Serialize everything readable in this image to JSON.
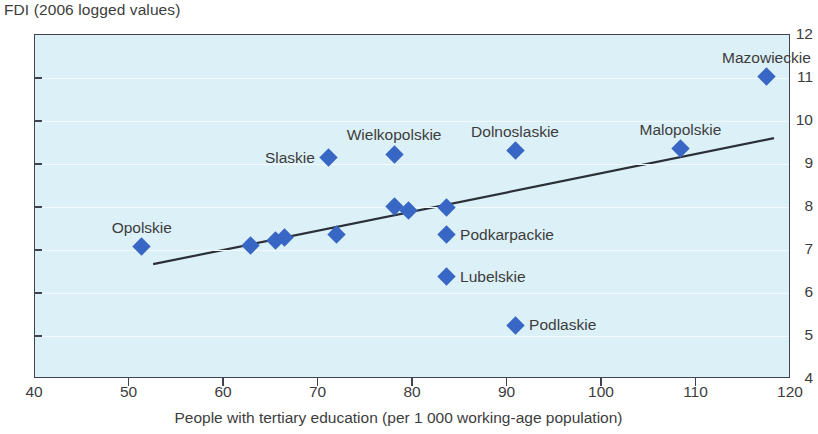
{
  "chart_data": {
    "type": "scatter",
    "title": "",
    "ylabel": "FDI (2006 logged values)",
    "xlabel": "People with tertiary education (per 1 000 working-age population)",
    "xlim": [
      40,
      120
    ],
    "ylim": [
      4,
      12
    ],
    "xticks": [
      40,
      50,
      60,
      70,
      80,
      90,
      100,
      110,
      120
    ],
    "yticks": [
      4,
      5,
      6,
      7,
      8,
      9,
      10,
      11,
      12
    ],
    "grid": true,
    "legend": "none",
    "marker_color": "#3866c4",
    "plot_background": "#dcf0f7",
    "axis_color": "#3f4450",
    "points": [
      {
        "label": "Opolskie",
        "x": 51.3,
        "y": 7.08,
        "label_pos": "above"
      },
      {
        "label": "",
        "x": 62.8,
        "y": 7.1,
        "label_pos": "none"
      },
      {
        "label": "",
        "x": 65.4,
        "y": 7.22,
        "label_pos": "none"
      },
      {
        "label": "",
        "x": 66.4,
        "y": 7.28,
        "label_pos": "none"
      },
      {
        "label": "Slaskie",
        "x": 71.1,
        "y": 9.15,
        "label_pos": "left"
      },
      {
        "label": "",
        "x": 71.9,
        "y": 7.36,
        "label_pos": "none"
      },
      {
        "label": "Wielkopolskie",
        "x": 78.0,
        "y": 9.23,
        "label_pos": "above"
      },
      {
        "label": "",
        "x": 78.0,
        "y": 8.02,
        "label_pos": "none"
      },
      {
        "label": "",
        "x": 79.5,
        "y": 7.92,
        "label_pos": "none"
      },
      {
        "label": "",
        "x": 83.5,
        "y": 7.98,
        "label_pos": "none"
      },
      {
        "label": "Podkarpackie",
        "x": 83.5,
        "y": 7.35,
        "label_pos": "right"
      },
      {
        "label": "Lubelskie",
        "x": 83.5,
        "y": 6.38,
        "label_pos": "right"
      },
      {
        "label": "Podlaskie",
        "x": 90.8,
        "y": 5.25,
        "label_pos": "right"
      },
      {
        "label": "Dolnoslaskie",
        "x": 90.8,
        "y": 9.31,
        "label_pos": "above"
      },
      {
        "label": "Malopolskie",
        "x": 108.3,
        "y": 9.35,
        "label_pos": "above"
      },
      {
        "label": "Mazowieckie",
        "x": 117.4,
        "y": 11.03,
        "label_pos": "above"
      }
    ],
    "trendline": {
      "x_start": 52.5,
      "y_start": 6.67,
      "x_end": 118.2,
      "y_end": 9.6
    }
  }
}
